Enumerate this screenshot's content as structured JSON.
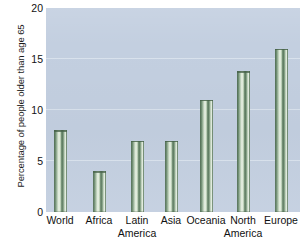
{
  "chart_data": {
    "type": "bar",
    "title": "",
    "xlabel": "",
    "ylabel": "Percentage of people older than age 65",
    "categories": [
      "World",
      "Africa",
      "Latin America",
      "Asia",
      "Oceania",
      "North America",
      "Europe"
    ],
    "category_lines": [
      [
        "World",
        ""
      ],
      [
        "Africa",
        ""
      ],
      [
        "Latin",
        "America"
      ],
      [
        "Asia",
        ""
      ],
      [
        "Oceania",
        ""
      ],
      [
        "North",
        "America"
      ],
      [
        "Europe",
        ""
      ]
    ],
    "values": [
      8,
      4,
      7,
      7,
      11,
      13.8,
      16
    ],
    "ylim": [
      0,
      20
    ],
    "yticks": [
      0,
      5,
      10,
      15,
      20
    ],
    "ytick_labels": [
      "0",
      "5",
      "10",
      "15",
      "20"
    ],
    "grid": true,
    "grid_axis": "y",
    "legend": false,
    "colors": {
      "plot_background": "#c3cfe0",
      "gridline": "#dde5ef",
      "bar_dark": "#4e6b52",
      "bar_mid": "#7d9a7e",
      "bar_light": "#eef5ea",
      "text": "#111111",
      "page_background": "#ffffff"
    }
  }
}
